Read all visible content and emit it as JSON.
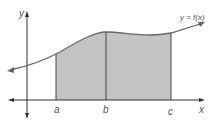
{
  "diagram": {
    "type": "area-under-curve",
    "curve_label": "y = f(x)",
    "axis_labels": {
      "x": "x",
      "y": "y"
    },
    "points": {
      "a": "a",
      "b": "b",
      "c": "c"
    },
    "colors": {
      "shade": "#bdbdbd",
      "stroke": "#555555",
      "axis": "#333333",
      "label": "#555555"
    }
  }
}
